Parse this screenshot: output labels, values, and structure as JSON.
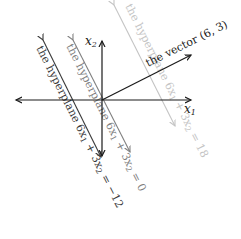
{
  "diagram": {
    "type": "hyperplanes-and-normal-vector",
    "axes": {
      "x_label": "x",
      "x_sub": "1",
      "y_label": "x",
      "y_sub": "2"
    },
    "vector": {
      "label": "the vector (6, 3)",
      "components": [
        6,
        3
      ],
      "color": "#1a1a1a"
    },
    "hyperplanes": [
      {
        "label_prefix": "the hyperplane 6x",
        "label_mid": " + 3x",
        "label_suffix": " = −12",
        "value": -12,
        "color": "#3a3a3a"
      },
      {
        "label_prefix": "the hyperplane 6x",
        "label_mid": " + 3x",
        "label_suffix": " = 0",
        "value": 0,
        "color": "#808080"
      },
      {
        "label_prefix": "the hyperplane 6x",
        "label_mid": " + 3x",
        "label_suffix": " = 18",
        "value": 18,
        "color": "#c4c4c4"
      }
    ]
  }
}
